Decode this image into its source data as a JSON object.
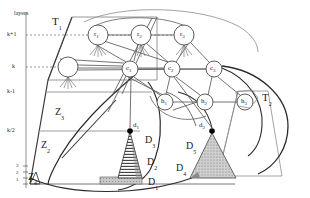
{
  "figure": {
    "name": "layered-network-diagram",
    "background": "#ffffff",
    "stroke": "#222222",
    "axis_caption": "layers"
  },
  "axis": {
    "caption": "layers",
    "ticks": [
      {
        "label": "k+1",
        "y": 35,
        "dashed": true
      },
      {
        "label": "k",
        "y": 67,
        "dashed": true
      },
      {
        "label": "k-1",
        "y": 92,
        "dashed": false
      },
      {
        "label": "k/2",
        "y": 131,
        "dashed": false
      }
    ],
    "bottom_ticks": [
      "3",
      "2",
      "1"
    ]
  },
  "regions": [
    {
      "name": "trapezoid-T1",
      "label": "T",
      "sub": "1",
      "x": 52,
      "y": 20
    },
    {
      "name": "trapezoid-T2",
      "label": "T",
      "sub": "2",
      "x": 262,
      "y": 96
    },
    {
      "name": "zone-Z3",
      "label": "Z",
      "sub": "3",
      "x": 55,
      "y": 112
    },
    {
      "name": "zone-Z2",
      "label": "Z",
      "sub": "2",
      "x": 41,
      "y": 144
    },
    {
      "name": "zone-Z4",
      "label": "Z",
      "sub": "4",
      "x": 28,
      "y": 176
    }
  ],
  "nodes": {
    "r_layer": [
      {
        "name": "node-r1",
        "label": "r",
        "sub": "1",
        "cx": 98,
        "cy": 35,
        "r": 10
      },
      {
        "name": "node-r2",
        "label": "r",
        "sub": "2",
        "cx": 141,
        "cy": 35,
        "r": 10
      },
      {
        "name": "node-r3",
        "label": "r",
        "sub": "3",
        "cx": 184,
        "cy": 35,
        "r": 10
      }
    ],
    "k_layer": [
      {
        "name": "node-unlabeled-k",
        "label": "",
        "sub": "",
        "cx": 68,
        "cy": 67,
        "r": 10
      }
    ],
    "c_layer": [
      {
        "name": "node-c1",
        "label": "c",
        "sub": "1",
        "cx": 130,
        "cy": 69,
        "r": 8
      },
      {
        "name": "node-c2",
        "label": "c",
        "sub": "2",
        "cx": 172,
        "cy": 69,
        "r": 8
      },
      {
        "name": "node-c3",
        "label": "c",
        "sub": "3",
        "cx": 214,
        "cy": 69,
        "r": 8
      }
    ],
    "h_layer": [
      {
        "name": "node-h1",
        "label": "h",
        "sub": "1",
        "cx": 165,
        "cy": 102,
        "r": 8
      },
      {
        "name": "node-h2",
        "label": "h",
        "sub": "2",
        "cx": 205,
        "cy": 102,
        "r": 8
      },
      {
        "name": "node-h3",
        "label": "h",
        "sub": "3",
        "cx": 245,
        "cy": 102,
        "r": 8
      }
    ]
  },
  "points": [
    {
      "name": "point-d1",
      "label": "d",
      "sub": "1",
      "cx": 130,
      "cy": 131,
      "lx": 133,
      "ly": 125
    },
    {
      "name": "point-d2",
      "label": "d",
      "sub": "2",
      "cx": 212,
      "cy": 131,
      "lx": 199,
      "ly": 125
    }
  ],
  "distributions": [
    {
      "name": "region-D3",
      "label": "D",
      "sub": "3",
      "x": 135,
      "y": 139
    },
    {
      "name": "region-D2",
      "label": "D",
      "sub": "2",
      "x": 138,
      "y": 160
    },
    {
      "name": "region-D1",
      "label": "D",
      "sub": "1",
      "x": 140,
      "y": 180
    },
    {
      "name": "region-D5",
      "label": "D",
      "sub": "5",
      "x": 186,
      "y": 145
    },
    {
      "name": "region-D4",
      "label": "D",
      "sub": "4",
      "x": 178,
      "y": 168
    }
  ],
  "colors": {
    "stroke": "#222222",
    "light_stroke": "#8a8a8a",
    "fill_gray": "#b8b8b8",
    "hatch": "#444444",
    "dot": "#000000"
  }
}
